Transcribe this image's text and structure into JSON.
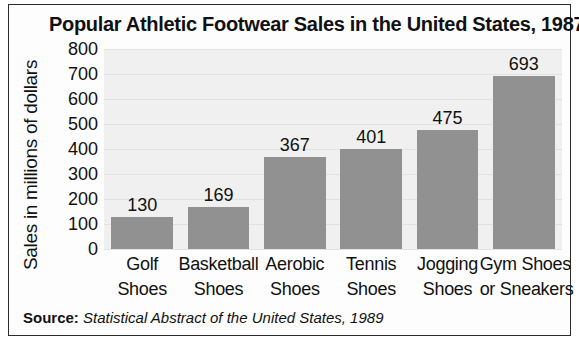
{
  "chart_data": {
    "type": "bar",
    "title": "Popular Athletic Footwear Sales in the United States, 1987",
    "xlabel": "",
    "ylabel": "Sales in millions of dollars",
    "categories": [
      "Golf Shoes",
      "Basketball Shoes",
      "Aerobic Shoes",
      "Tennis Shoes",
      "Jogging Shoes",
      "Gym Shoes or Sneakers"
    ],
    "category_lines": [
      [
        "Golf",
        "Shoes"
      ],
      [
        "Basketball",
        "Shoes"
      ],
      [
        "Aerobic",
        "Shoes"
      ],
      [
        "Tennis",
        "Shoes"
      ],
      [
        "Jogging",
        "Shoes"
      ],
      [
        "Gym Shoes",
        "or Sneakers"
      ]
    ],
    "values": [
      130,
      169,
      367,
      401,
      475,
      693
    ],
    "value_labels": [
      "130",
      "169",
      "367",
      "401",
      "475",
      "693"
    ],
    "ylim": [
      0,
      800
    ],
    "ytick_labels": [
      "800",
      "700",
      "600",
      "500",
      "400",
      "300",
      "200",
      "100",
      "0"
    ],
    "ytick_values": [
      800,
      700,
      600,
      500,
      400,
      300,
      200,
      100,
      0
    ],
    "grid": true,
    "legend": "none",
    "bar_color": "#919191",
    "plot_background": "#f0f0f0",
    "text_color": "#111111"
  },
  "source": {
    "key": "Source:",
    "value": "Statistical Abstract of the United States, 1989"
  }
}
